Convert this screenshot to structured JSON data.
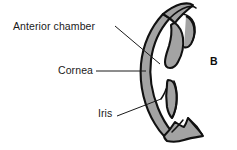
{
  "figure": {
    "type": "anatomical-diagram",
    "panel_letter": "B",
    "background_color": "#ffffff",
    "tissue_fill_color": "#a3a3a3",
    "tissue_outline_color": "#111111",
    "leader_line_color": "#1a1a1a",
    "text_color": "#1a1a1a",
    "labels": [
      {
        "id": "anterior-chamber",
        "text": "Anterior chamber",
        "leader": {
          "from_x": 115,
          "from_y": 26,
          "to_x": 160,
          "to_y": 64
        }
      },
      {
        "id": "cornea",
        "text": "Cornea",
        "leader": {
          "from_x": 96,
          "from_y": 71,
          "to_x": 146,
          "to_y": 71
        }
      },
      {
        "id": "iris",
        "text": "Iris",
        "leader": {
          "from_x": 117,
          "from_y": 116,
          "to_x": 161,
          "to_y": 99
        }
      }
    ]
  }
}
